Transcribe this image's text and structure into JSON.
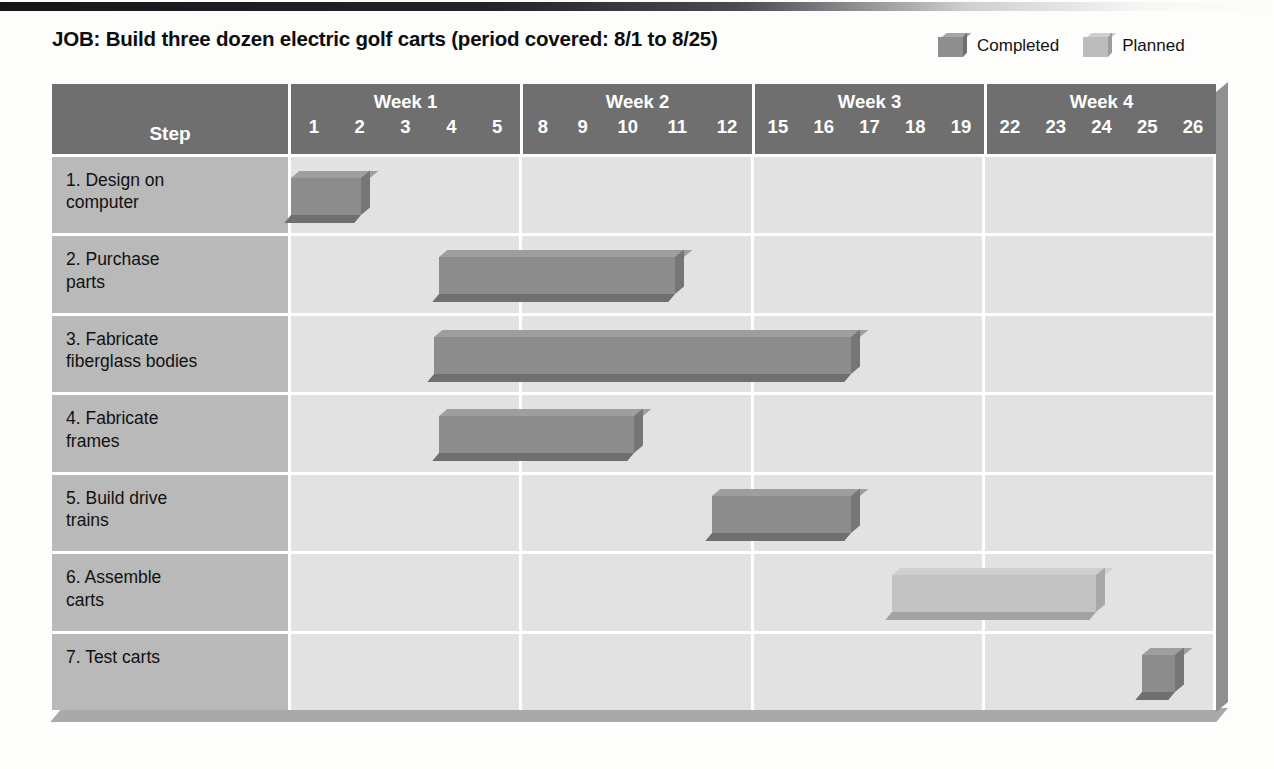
{
  "title": "JOB: Build three dozen electric golf carts (period covered: 8/1 to 8/25)",
  "legend": {
    "completed_label": "Completed",
    "planned_label": "Planned",
    "completed_color": "#8c8c8c",
    "planned_color": "#c2c2c2"
  },
  "header": {
    "step_label": "Step"
  },
  "chart_data": {
    "type": "bar",
    "subtype": "gantt",
    "title": "JOB: Build three dozen electric golf carts (period covered: 8/1 to 8/25)",
    "xlabel": "",
    "ylabel": "Step",
    "grid": true,
    "legend_position": "top-right",
    "period_start": "8/1",
    "period_end": "8/25",
    "weeks": [
      {
        "name": "Week 1",
        "days": [
          "1",
          "2",
          "3",
          "4",
          "5"
        ]
      },
      {
        "name": "Week 2",
        "days": [
          "8",
          "9",
          "10",
          "11",
          "12"
        ]
      },
      {
        "name": "Week 3",
        "days": [
          "15",
          "16",
          "17",
          "18",
          "19"
        ]
      },
      {
        "name": "Week 4",
        "days": [
          "22",
          "23",
          "24",
          "25",
          "26"
        ]
      }
    ],
    "day_slots": [
      "1",
      "2",
      "3",
      "4",
      "5",
      "8",
      "9",
      "10",
      "11",
      "12",
      "15",
      "16",
      "17",
      "18",
      "19",
      "22",
      "23",
      "24",
      "25",
      "26"
    ],
    "categories": [
      "1. Design on computer",
      "2. Purchase parts",
      "3. Fabricate fiberglass bodies",
      "4. Fabricate frames",
      "5. Build drive trains",
      "6. Assemble carts",
      "7. Test carts"
    ],
    "tasks": [
      {
        "step": "1. Design on\ncomputer",
        "status": "Completed",
        "start_day": "1",
        "end_day": "2",
        "start_slot": 0,
        "span_slots": 1.7
      },
      {
        "step": "2. Purchase\nparts",
        "status": "Completed",
        "start_day": "4",
        "end_day": "10",
        "start_slot": 3.2,
        "span_slots": 5.3
      },
      {
        "step": "3. Fabricate\nfiberglass bodies",
        "status": "Completed",
        "start_day": "4",
        "end_day": "16",
        "start_slot": 3.1,
        "span_slots": 9.2
      },
      {
        "step": "4. Fabricate\nframes",
        "status": "Completed",
        "start_day": "4",
        "end_day": "9",
        "start_slot": 3.2,
        "span_slots": 4.4
      },
      {
        "step": "5. Build drive\ntrains",
        "status": "Completed",
        "start_day": "11",
        "end_day": "16",
        "start_slot": 9.1,
        "span_slots": 3.2
      },
      {
        "step": "6. Assemble\ncarts",
        "status": "Planned",
        "start_day": "17",
        "end_day": "22",
        "start_slot": 13.0,
        "span_slots": 4.6
      },
      {
        "step": "7. Test carts",
        "status": "Completed",
        "start_day": "25",
        "end_day": "25",
        "start_slot": 18.4,
        "span_slots": 0.9
      }
    ]
  }
}
